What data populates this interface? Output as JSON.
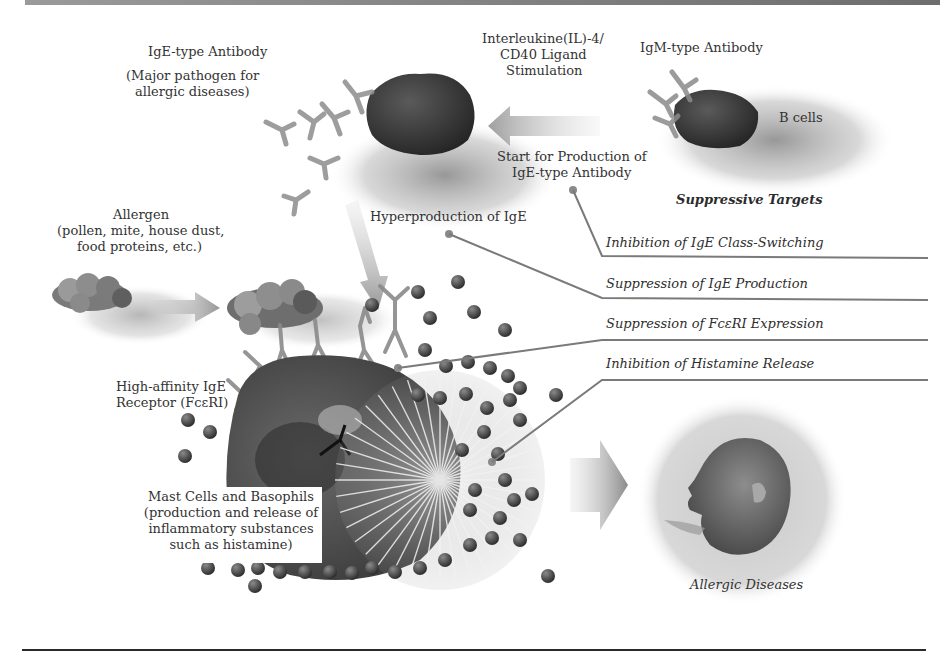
{
  "figure": {
    "type": "illustration"
  },
  "labels": {
    "ige_antibody": "IgE-type Antibody",
    "ige_antibody_note_1": "(Major pathogen for",
    "ige_antibody_note_2": "allergic diseases)",
    "il4_line1": "Interleukine(IL)-4/",
    "il4_line2": "CD40 Ligand",
    "il4_line3": "Stimulation",
    "igm_antibody": "IgM-type Antibody",
    "b_cells": "B cells",
    "start_production_line1": "Start for Production of",
    "start_production_line2": "IgE-type Antibody",
    "suppressive_targets": "Suppressive Targets",
    "hyperproduction": "Hyperproduction of IgE",
    "allergen_line1": "Allergen",
    "allergen_line2": "(pollen, mite, house dust,",
    "allergen_line3": "food proteins, etc.)",
    "receptor_line1": "High-affinity IgE",
    "receptor_line2": "Receptor (FcεRI)",
    "mast_line1": "Mast Cells and Basophils",
    "mast_line2": "(production and release of",
    "mast_line3": "inflammatory substances",
    "mast_line4": "such as histamine)",
    "allergic_diseases": "Allergic Diseases"
  },
  "suppressive_targets": [
    {
      "label": "Inhibition of IgE Class-Switching"
    },
    {
      "label": "Suppression of IgE Production"
    },
    {
      "label": "Suppression of FcεRI Expression"
    },
    {
      "label": "Inhibition of Histamine Release"
    }
  ],
  "colors": {
    "cell_dark": "#3a3a3a",
    "shadow": "#9c9c9c",
    "leader_line": "#7a7a7a",
    "granule": "#4a4a4a",
    "arrow": "#9a9a9a"
  }
}
